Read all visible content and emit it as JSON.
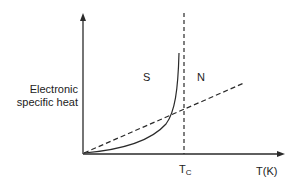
{
  "diagram": {
    "type": "specific-heat-vs-temperature",
    "y_axis_label_line1": "Electronic",
    "y_axis_label_line2": "specific heat",
    "x_axis_label": "T(K)",
    "critical_temp_label_main": "T",
    "critical_temp_label_sub": "C",
    "region_superconducting": "S",
    "region_normal": "N",
    "curves": [
      {
        "name": "superconducting-state",
        "style": "solid",
        "description": "exponential rise from origin to peak just below Tc"
      },
      {
        "name": "normal-state",
        "style": "dashed",
        "description": "linear from origin"
      },
      {
        "name": "critical-temperature-line",
        "style": "dashed",
        "description": "vertical line at Tc"
      }
    ],
    "colors": {
      "line": "#2a2a2a",
      "text": "#222222",
      "background": "#ffffff"
    }
  }
}
